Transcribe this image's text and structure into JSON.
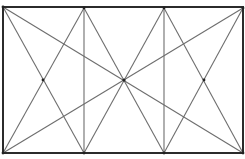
{
  "diagram": {
    "title": "",
    "width": 245,
    "height": 159,
    "colors": {
      "frame": "#2b2b2b",
      "line": "#6e6e6e",
      "background": "#ffffff"
    },
    "frame": {
      "x1": 3,
      "y1": 7,
      "x2": 243,
      "y2": 153
    },
    "points": {
      "top_left": [
        3,
        7
      ],
      "top_v1": [
        84,
        8
      ],
      "top_v2": [
        164,
        8
      ],
      "top_right": [
        243,
        8
      ],
      "bottom_left": [
        3,
        153
      ],
      "bottom_v1": [
        84,
        153
      ],
      "bottom_v2": [
        164,
        153
      ],
      "bottom_right": [
        243,
        153
      ],
      "center": [
        124,
        80
      ],
      "left_cross": [
        43,
        80
      ],
      "right_cross": [
        204,
        80
      ]
    },
    "segments": [
      {
        "name": "main-diagonal-tl-br",
        "from": [
          3,
          7
        ],
        "to": [
          243,
          153
        ]
      },
      {
        "name": "main-diagonal-tr-bl",
        "from": [
          243,
          8
        ],
        "to": [
          3,
          153
        ]
      },
      {
        "name": "vertical-left",
        "from": [
          84,
          8
        ],
        "to": [
          84,
          153
        ]
      },
      {
        "name": "vertical-right",
        "from": [
          164,
          8
        ],
        "to": [
          164,
          153
        ]
      },
      {
        "name": "left-x-a",
        "from": [
          3,
          7
        ],
        "to": [
          84,
          153
        ]
      },
      {
        "name": "left-x-b",
        "from": [
          84,
          8
        ],
        "to": [
          3,
          153
        ]
      },
      {
        "name": "center-x-a",
        "from": [
          84,
          8
        ],
        "to": [
          164,
          153
        ]
      },
      {
        "name": "center-x-b",
        "from": [
          164,
          8
        ],
        "to": [
          84,
          153
        ]
      },
      {
        "name": "right-x-a",
        "from": [
          164,
          8
        ],
        "to": [
          243,
          153
        ]
      },
      {
        "name": "right-x-b",
        "from": [
          243,
          8
        ],
        "to": [
          164,
          153
        ]
      }
    ]
  }
}
